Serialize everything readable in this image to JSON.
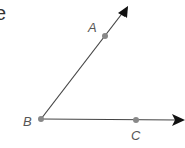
{
  "partial_text": "e",
  "diagram": {
    "type": "angle",
    "vertex": {
      "label": "B",
      "x": 41,
      "y": 119
    },
    "rays": [
      {
        "name": "ray-BA",
        "through": {
          "label": "A",
          "x": 105,
          "y": 35
        },
        "tip": {
          "x": 128,
          "y": 6
        }
      },
      {
        "name": "ray-BC",
        "through": {
          "label": "C",
          "x": 136,
          "y": 120
        },
        "tip": {
          "x": 184,
          "y": 120
        }
      }
    ],
    "labels": {
      "A": "A",
      "B": "B",
      "C": "C"
    },
    "colors": {
      "line": "#444444",
      "point": "#888888",
      "arrow": "#111111",
      "label": "#555555"
    }
  }
}
